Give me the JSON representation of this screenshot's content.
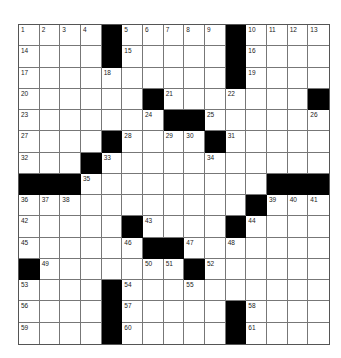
{
  "puzzle": {
    "rows": 15,
    "cols": 15,
    "colors": {
      "black": "#000000",
      "white": "#ffffff",
      "line": "#777777"
    },
    "black_cells": [
      [
        0,
        4
      ],
      [
        0,
        10
      ],
      [
        1,
        4
      ],
      [
        1,
        10
      ],
      [
        2,
        10
      ],
      [
        3,
        6
      ],
      [
        3,
        14
      ],
      [
        4,
        7
      ],
      [
        4,
        8
      ],
      [
        5,
        4
      ],
      [
        5,
        9
      ],
      [
        6,
        3
      ],
      [
        7,
        0
      ],
      [
        7,
        1
      ],
      [
        7,
        2
      ],
      [
        7,
        12
      ],
      [
        7,
        13
      ],
      [
        7,
        14
      ],
      [
        8,
        11
      ],
      [
        9,
        5
      ],
      [
        9,
        10
      ],
      [
        10,
        6
      ],
      [
        10,
        7
      ],
      [
        11,
        0
      ],
      [
        11,
        8
      ],
      [
        12,
        4
      ],
      [
        13,
        4
      ],
      [
        13,
        10
      ],
      [
        14,
        4
      ],
      [
        14,
        10
      ]
    ],
    "numbers": [
      {
        "r": 0,
        "c": 0,
        "n": "1"
      },
      {
        "r": 0,
        "c": 1,
        "n": "2"
      },
      {
        "r": 0,
        "c": 2,
        "n": "3"
      },
      {
        "r": 0,
        "c": 3,
        "n": "4"
      },
      {
        "r": 0,
        "c": 5,
        "n": "5"
      },
      {
        "r": 0,
        "c": 6,
        "n": "6"
      },
      {
        "r": 0,
        "c": 7,
        "n": "7"
      },
      {
        "r": 0,
        "c": 8,
        "n": "8"
      },
      {
        "r": 0,
        "c": 9,
        "n": "9"
      },
      {
        "r": 0,
        "c": 11,
        "n": "10"
      },
      {
        "r": 0,
        "c": 12,
        "n": "11"
      },
      {
        "r": 0,
        "c": 13,
        "n": "12"
      },
      {
        "r": 0,
        "c": 14,
        "n": "13"
      },
      {
        "r": 1,
        "c": 0,
        "n": "14"
      },
      {
        "r": 1,
        "c": 5,
        "n": "15"
      },
      {
        "r": 1,
        "c": 11,
        "n": "16"
      },
      {
        "r": 2,
        "c": 0,
        "n": "17"
      },
      {
        "r": 2,
        "c": 4,
        "n": "18"
      },
      {
        "r": 2,
        "c": 11,
        "n": "19"
      },
      {
        "r": 3,
        "c": 0,
        "n": "20"
      },
      {
        "r": 3,
        "c": 7,
        "n": "21"
      },
      {
        "r": 3,
        "c": 10,
        "n": "22"
      },
      {
        "r": 4,
        "c": 0,
        "n": "23"
      },
      {
        "r": 4,
        "c": 6,
        "n": "24"
      },
      {
        "r": 4,
        "c": 9,
        "n": "25"
      },
      {
        "r": 4,
        "c": 14,
        "n": "26"
      },
      {
        "r": 5,
        "c": 0,
        "n": "27"
      },
      {
        "r": 5,
        "c": 5,
        "n": "28"
      },
      {
        "r": 5,
        "c": 7,
        "n": "29"
      },
      {
        "r": 5,
        "c": 8,
        "n": "30"
      },
      {
        "r": 5,
        "c": 10,
        "n": "31"
      },
      {
        "r": 6,
        "c": 0,
        "n": "32"
      },
      {
        "r": 6,
        "c": 4,
        "n": "33"
      },
      {
        "r": 6,
        "c": 9,
        "n": "34"
      },
      {
        "r": 7,
        "c": 3,
        "n": "35"
      },
      {
        "r": 8,
        "c": 0,
        "n": "36"
      },
      {
        "r": 8,
        "c": 1,
        "n": "37"
      },
      {
        "r": 8,
        "c": 2,
        "n": "38"
      },
      {
        "r": 8,
        "c": 12,
        "n": "39"
      },
      {
        "r": 8,
        "c": 13,
        "n": "40"
      },
      {
        "r": 8,
        "c": 14,
        "n": "41"
      },
      {
        "r": 9,
        "c": 0,
        "n": "42"
      },
      {
        "r": 9,
        "c": 6,
        "n": "43"
      },
      {
        "r": 9,
        "c": 11,
        "n": "44"
      },
      {
        "r": 10,
        "c": 0,
        "n": "45"
      },
      {
        "r": 10,
        "c": 5,
        "n": "46"
      },
      {
        "r": 10,
        "c": 8,
        "n": "47"
      },
      {
        "r": 10,
        "c": 10,
        "n": "48"
      },
      {
        "r": 11,
        "c": 1,
        "n": "49"
      },
      {
        "r": 11,
        "c": 6,
        "n": "50"
      },
      {
        "r": 11,
        "c": 7,
        "n": "51"
      },
      {
        "r": 11,
        "c": 9,
        "n": "52"
      },
      {
        "r": 12,
        "c": 0,
        "n": "53"
      },
      {
        "r": 12,
        "c": 5,
        "n": "54"
      },
      {
        "r": 12,
        "c": 8,
        "n": "55"
      },
      {
        "r": 13,
        "c": 0,
        "n": "56"
      },
      {
        "r": 13,
        "c": 5,
        "n": "57"
      },
      {
        "r": 13,
        "c": 11,
        "n": "58"
      },
      {
        "r": 14,
        "c": 0,
        "n": "59"
      },
      {
        "r": 14,
        "c": 5,
        "n": "60"
      },
      {
        "r": 14,
        "c": 11,
        "n": "61"
      }
    ]
  }
}
